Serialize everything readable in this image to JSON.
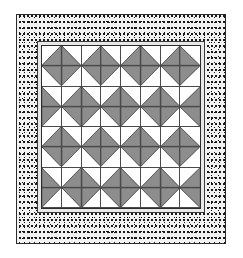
{
  "figure": {
    "width": 243,
    "height": 258
  },
  "colors": {
    "background": "#ffffff",
    "patch_light": "#ffffff",
    "patch_dark": "#8d8d8d",
    "seam_line": "#2a2a2a",
    "frame_fill": "#e8e8e8",
    "border_fill": "#f2f2f2",
    "border_dot": "#111111"
  },
  "border": {
    "name": "speckled-print-border",
    "style": "dotted-speckle",
    "outline_color": "#2b2b2b"
  },
  "inner_frame": {
    "name": "sashing-frame",
    "style": "solid-light"
  },
  "grid": {
    "rows": 8,
    "columns": 8,
    "unit_type": "half-square-triangle",
    "legend": {
      "tl": "dark triangle in top-left corner",
      "tr": "dark triangle in top-right corner",
      "bl": "dark triangle in bottom-left corner",
      "br": "dark triangle in bottom-right corner"
    },
    "cells": [
      [
        "br",
        "bl",
        "br",
        "bl",
        "br",
        "bl",
        "br",
        "bl"
      ],
      [
        "tr",
        "tl",
        "tr",
        "tl",
        "tr",
        "tl",
        "tr",
        "tl"
      ],
      [
        "bl",
        "br",
        "bl",
        "br",
        "bl",
        "br",
        "bl",
        "br"
      ],
      [
        "tl",
        "tr",
        "tl",
        "tr",
        "tl",
        "tr",
        "tl",
        "tr"
      ],
      [
        "br",
        "bl",
        "br",
        "bl",
        "br",
        "bl",
        "br",
        "bl"
      ],
      [
        "tr",
        "tl",
        "tr",
        "tl",
        "tr",
        "tl",
        "tr",
        "tl"
      ],
      [
        "bl",
        "br",
        "bl",
        "br",
        "bl",
        "br",
        "bl",
        "br"
      ],
      [
        "tl",
        "tr",
        "tl",
        "tr",
        "tl",
        "tr",
        "tl",
        "tr"
      ]
    ]
  }
}
